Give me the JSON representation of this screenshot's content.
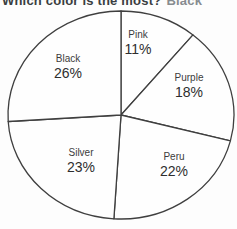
{
  "title": {
    "question": "Which color is the most?",
    "answer": "Black"
  },
  "colors": {
    "question_text": "#3a3e41",
    "answer_text": "#878c90",
    "outline": "#3f3f3f",
    "slice_fill": "#fefefe",
    "label_text": "#353535"
  },
  "chart_data": {
    "type": "pie",
    "title": "Which color is the most?",
    "categories": [
      "Pink",
      "Purple",
      "Peru",
      "Silver",
      "Black"
    ],
    "values": [
      11,
      18,
      22,
      23,
      26
    ],
    "unit": "%",
    "total": 100,
    "start_angle": "12 o'clock",
    "direction": "clockwise",
    "legend_position": "none",
    "labels_inside_slices": true,
    "layout": {
      "ellipse": {
        "cx": 121,
        "cy": 115,
        "rx": 113,
        "ry": 104
      },
      "label_anchors": [
        {
          "x": 138,
          "y": 43
        },
        {
          "x": 189,
          "y": 86
        },
        {
          "x": 174,
          "y": 165
        },
        {
          "x": 81,
          "y": 161
        },
        {
          "x": 68,
          "y": 67
        }
      ]
    }
  }
}
